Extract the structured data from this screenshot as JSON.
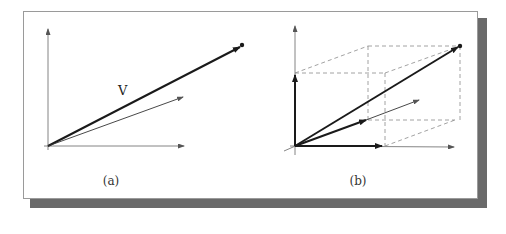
{
  "figure": {
    "panels": [
      {
        "id": "a",
        "caption": "(a)",
        "vector_label": "V",
        "description": "2D vector V from origin with a thinner companion vector"
      },
      {
        "id": "b",
        "caption": "(b)",
        "description": "3D vector V decomposed into x, y, z components inside a dashed box"
      }
    ],
    "colors": {
      "frame_border": "#9a9a9a",
      "shadow": "#6a6a6a",
      "axis": "#555555",
      "vector": "#1a1a1a",
      "dashed": "#8a8a8a"
    }
  }
}
